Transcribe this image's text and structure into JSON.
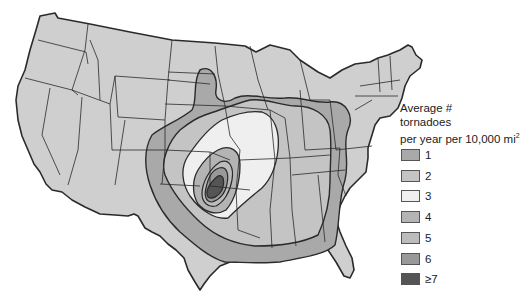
{
  "map": {
    "title_lines": [
      "Average #",
      "tornadoes",
      "per year per 10,000 mi"
    ],
    "title_superscript": "2",
    "region": "Contiguous United States",
    "colors": {
      "base": "#cfcfcf",
      "border": "#2a2a2a",
      "background": "#ffffff"
    }
  },
  "legend": {
    "items": [
      {
        "label": "1",
        "color": "#a9a9a9"
      },
      {
        "label": "2",
        "color": "#c4c4c4"
      },
      {
        "label": "3",
        "color": "#efefef"
      },
      {
        "label": "4",
        "color": "#b4b4b4"
      },
      {
        "label": "5",
        "color": "#bcbcbc"
      },
      {
        "label": "6",
        "color": "#999999"
      },
      {
        "label": "≥7",
        "color": "#555555"
      }
    ]
  }
}
